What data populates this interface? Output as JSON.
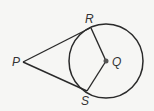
{
  "diagram": {
    "type": "geometry",
    "labels": {
      "P": "P",
      "Q": "Q",
      "R": "R",
      "S": "S"
    },
    "circle": {
      "center": "Q",
      "cx": 106,
      "cy": 61,
      "r": 37
    },
    "points": {
      "P": [
        23,
        62
      ],
      "Q": [
        106,
        61
      ],
      "R": [
        90,
        28
      ],
      "S": [
        87,
        91
      ]
    },
    "segments": [
      "PR",
      "PS",
      "QR",
      "QS"
    ],
    "colors": {
      "stroke": "#2a2a2a",
      "background": "#f6f6f4"
    }
  }
}
